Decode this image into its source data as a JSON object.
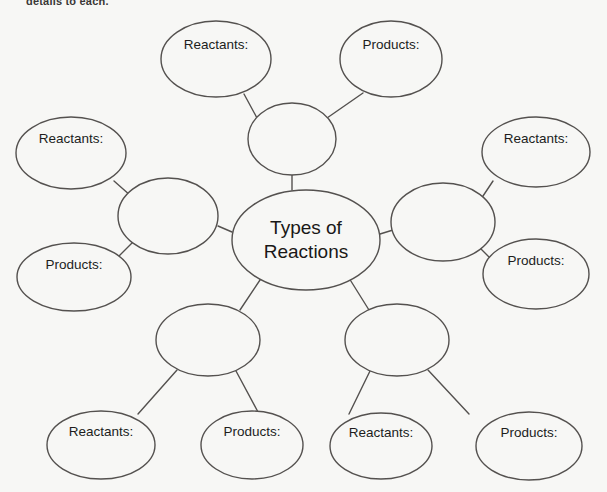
{
  "page": {
    "background_color": "#f7f7f5",
    "line_color": "#54514f",
    "text_color": "#201d1c",
    "partial_instruction": "details to each."
  },
  "diagram": {
    "type": "concept-map",
    "center": {
      "label_line_1": "Types of",
      "label_line_2": "Reactions",
      "cx": 306,
      "cy": 240,
      "rx": 74,
      "ry": 50
    },
    "branches": [
      {
        "id": "top",
        "hub": {
          "label": "",
          "cx": 292,
          "cy": 139,
          "rx": 44,
          "ry": 36
        },
        "leaves": [
          {
            "id": "top-reactants",
            "label": "Reactants:",
            "cx": 216,
            "cy": 59,
            "rx": 55,
            "ry": 38,
            "label_dy": -14
          },
          {
            "id": "top-products",
            "label": "Products:",
            "cx": 391,
            "cy": 59,
            "rx": 51,
            "ry": 38,
            "label_dy": -14
          }
        ]
      },
      {
        "id": "left",
        "hub": {
          "label": "",
          "cx": 168,
          "cy": 216,
          "rx": 50,
          "ry": 38
        },
        "leaves": [
          {
            "id": "left-reactants",
            "label": "Reactants:",
            "cx": 71,
            "cy": 153,
            "rx": 55,
            "ry": 36,
            "label_dy": -14
          },
          {
            "id": "left-products",
            "label": "Products:",
            "cx": 74,
            "cy": 277,
            "rx": 57,
            "ry": 34,
            "label_dy": -12
          }
        ]
      },
      {
        "id": "right",
        "hub": {
          "label": "",
          "cx": 443,
          "cy": 222,
          "rx": 52,
          "ry": 39
        },
        "leaves": [
          {
            "id": "right-reactants",
            "label": "Reactants:",
            "cx": 536,
            "cy": 152,
            "rx": 54,
            "ry": 35,
            "label_dy": -13
          },
          {
            "id": "right-products",
            "label": "Products:",
            "cx": 536,
            "cy": 274,
            "rx": 53,
            "ry": 35,
            "label_dy": -13
          }
        ]
      },
      {
        "id": "bottom-left",
        "hub": {
          "label": "",
          "cx": 208,
          "cy": 340,
          "rx": 52,
          "ry": 36
        },
        "leaves": [
          {
            "id": "bl-reactants",
            "label": "Reactants:",
            "cx": 101,
            "cy": 445,
            "rx": 54,
            "ry": 34,
            "label_dy": -13
          },
          {
            "id": "bl-products",
            "label": "Products:",
            "cx": 252,
            "cy": 445,
            "rx": 51,
            "ry": 34,
            "label_dy": -13
          }
        ]
      },
      {
        "id": "bottom-right",
        "hub": {
          "label": "",
          "cx": 397,
          "cy": 340,
          "rx": 52,
          "ry": 36
        },
        "leaves": [
          {
            "id": "br-reactants",
            "label": "Reactants:",
            "cx": 381,
            "cy": 446,
            "rx": 51,
            "ry": 33,
            "label_dy": -13
          },
          {
            "id": "br-products",
            "label": "Products:",
            "cx": 529,
            "cy": 446,
            "rx": 53,
            "ry": 34,
            "label_dy": -13
          }
        ]
      }
    ],
    "connectors": [
      {
        "id": "center-to-top",
        "x1": 292,
        "y1": 190,
        "x2": 292,
        "y2": 175
      },
      {
        "id": "center-to-left",
        "x1": 232,
        "y1": 232,
        "x2": 218,
        "y2": 226
      },
      {
        "id": "center-to-right",
        "x1": 380,
        "y1": 234,
        "x2": 393,
        "y2": 230
      },
      {
        "id": "center-to-bottom-left",
        "x1": 262,
        "y1": 277,
        "x2": 240,
        "y2": 310
      },
      {
        "id": "center-to-bottom-right",
        "x1": 349,
        "y1": 278,
        "x2": 369,
        "y2": 310
      },
      {
        "id": "top-hub-to-reactants",
        "x1": 257,
        "y1": 118,
        "x2": 244,
        "y2": 94
      },
      {
        "id": "top-hub-to-products",
        "x1": 327,
        "y1": 118,
        "x2": 363,
        "y2": 93
      },
      {
        "id": "left-hub-to-reactants",
        "x1": 131,
        "y1": 196,
        "x2": 114,
        "y2": 181
      },
      {
        "id": "left-hub-to-products",
        "x1": 132,
        "y1": 243,
        "x2": 119,
        "y2": 256
      },
      {
        "id": "right-hub-to-reactants",
        "x1": 479,
        "y1": 202,
        "x2": 493,
        "y2": 181
      },
      {
        "id": "right-hub-to-products",
        "x1": 480,
        "y1": 248,
        "x2": 494,
        "y2": 262
      },
      {
        "id": "bl-hub-to-reactants",
        "x1": 177,
        "y1": 370,
        "x2": 138,
        "y2": 414
      },
      {
        "id": "bl-hub-to-products",
        "x1": 236,
        "y1": 371,
        "x2": 258,
        "y2": 412
      },
      {
        "id": "br-hub-to-reactants",
        "x1": 370,
        "y1": 371,
        "x2": 349,
        "y2": 414
      },
      {
        "id": "br-hub-to-products",
        "x1": 428,
        "y1": 370,
        "x2": 469,
        "y2": 414
      }
    ]
  }
}
